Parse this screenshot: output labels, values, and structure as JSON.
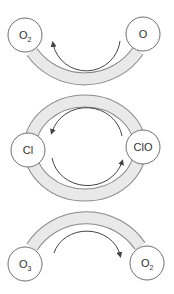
{
  "diagram": {
    "colors": {
      "band_fill": "#e9e9e9",
      "band_edge": "#8a8a8a",
      "node_fill": "#ffffff",
      "node_edge": "#6e6e6e",
      "arrow": "#444444",
      "text": "#333333"
    },
    "nodes": [
      {
        "id": "o2-top",
        "label": "O",
        "sub": "2",
        "cx": 25,
        "cy": 35
      },
      {
        "id": "o-top",
        "label": "O",
        "sub": "",
        "cx": 143,
        "cy": 34
      },
      {
        "id": "cl",
        "label": "Cl",
        "sub": "",
        "cx": 28,
        "cy": 150
      },
      {
        "id": "clo",
        "label": "ClO",
        "sub": "",
        "cx": 143,
        "cy": 147
      },
      {
        "id": "o3-bottom",
        "label": "O",
        "sub": "3",
        "cx": 25,
        "cy": 264
      },
      {
        "id": "o2-bottom",
        "label": "O",
        "sub": "2",
        "cx": 147,
        "cy": 263
      }
    ],
    "arrows": [
      {
        "id": "top-arrow",
        "from": "O",
        "to": "O2",
        "direction": "counter-clockwise (right to left, under)"
      },
      {
        "id": "middle-upper-arrow",
        "from": "ClO",
        "to": "Cl",
        "direction": "over top, right to left"
      },
      {
        "id": "middle-lower-arrow",
        "from": "Cl",
        "to": "ClO",
        "direction": "under bottom, left to right"
      },
      {
        "id": "bottom-arrow",
        "from": "O3",
        "to": "O2",
        "direction": "over top, left to right"
      }
    ]
  }
}
